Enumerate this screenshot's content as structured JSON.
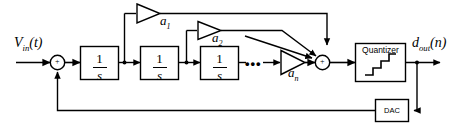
{
  "figure": {
    "type": "block-diagram",
    "background_color": "#ffffff",
    "line_color": "#000000"
  },
  "signals": {
    "input_label": "V",
    "input_sub": "in",
    "input_arg": "(t)",
    "output_label": "d",
    "output_sub": "out",
    "output_arg": "(n)"
  },
  "integrators": [
    {
      "name": "integrator-1",
      "numerator": "1",
      "denominator": "s"
    },
    {
      "name": "integrator-2",
      "numerator": "1",
      "denominator": "s"
    },
    {
      "name": "integrator-3",
      "numerator": "1",
      "denominator": "s"
    }
  ],
  "gains": [
    {
      "name": "gain-a1",
      "label": "a",
      "sub": "1"
    },
    {
      "name": "gain-a2",
      "label": "a",
      "sub": "2"
    },
    {
      "name": "gain-an",
      "label": "a",
      "sub": "n"
    }
  ],
  "blocks": {
    "quantizer": "Quantizer",
    "dac": "DAC"
  },
  "summing_nodes": [
    {
      "name": "input-summer",
      "symbol": "+"
    },
    {
      "name": "feedforward-summer",
      "symbol": "+"
    }
  ],
  "ellipsis": "•••"
}
